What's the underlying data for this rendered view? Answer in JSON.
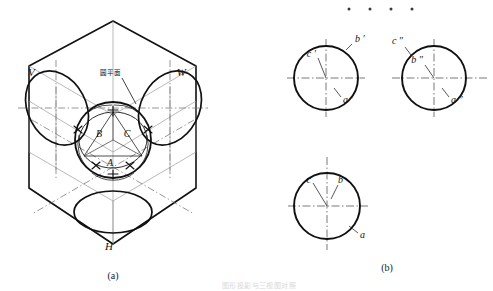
{
  "figure": {
    "panels": [
      {
        "id": "a",
        "caption": "(a)",
        "kind": "axonometric-projection-box",
        "plane_labels": [
          {
            "name": "V",
            "text": "V",
            "position": "upper-left"
          },
          {
            "name": "W",
            "text": "W",
            "position": "upper-right"
          },
          {
            "name": "H",
            "text": "H",
            "position": "bottom-center"
          }
        ],
        "annotation": {
          "text": "圆平面",
          "meaning": "circular plane",
          "position": "top-center-leader"
        },
        "point_labels": [
          {
            "text": "A",
            "position": "lower-center"
          },
          {
            "text": "B",
            "position": "upper-left"
          },
          {
            "text": "C",
            "position": "upper-right"
          }
        ]
      },
      {
        "id": "b",
        "caption": "(b)",
        "kind": "three-view-orthographic-projection",
        "views": [
          {
            "name": "front-view",
            "labels": [
              {
                "text": "b ′",
                "position": "outside-upper-right"
              },
              {
                "text": "c ′",
                "position": "inside-upper-left"
              },
              {
                "text": "a ′",
                "position": "inside-lower-right"
              }
            ]
          },
          {
            "name": "side-view",
            "labels": [
              {
                "text": "c ″",
                "position": "outside-upper-left"
              },
              {
                "text": "b ″",
                "position": "inside-upper-left"
              },
              {
                "text": "a ″",
                "position": "inside-lower-right"
              }
            ]
          },
          {
            "name": "top-view",
            "labels": [
              {
                "text": "c",
                "position": "inside-upper-left"
              },
              {
                "text": "b",
                "position": "inside-upper-right"
              },
              {
                "text": "a",
                "position": "outside-lower-right"
              }
            ]
          }
        ]
      }
    ],
    "dots_row": [
      "·",
      "·",
      "·",
      "·"
    ],
    "footer_text": "图形投影与三视图对照"
  },
  "colors": {
    "ink": "#111111",
    "thin": "#6b6b6b",
    "centerline": "#5a5a5a",
    "paper": "#ffffff"
  }
}
